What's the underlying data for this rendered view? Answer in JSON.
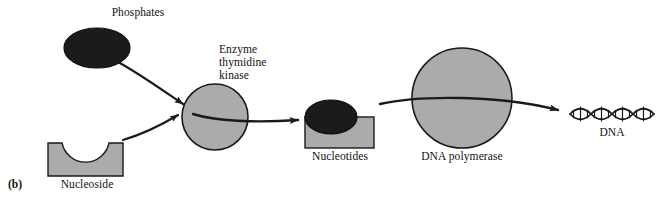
{
  "figure": {
    "panel_letter": "(b)",
    "width": 671,
    "height": 198,
    "background": "#ffffff"
  },
  "colors": {
    "shape_gray_fill": "#ababab",
    "shape_dark_fill": "#1d1a1a",
    "outline": "#1a1a1a",
    "text": "#111111"
  },
  "labels": {
    "phosphates": "Phosphates",
    "nucleoside": "Nucleoside",
    "enzyme_line1": "Enzyme",
    "enzyme_line2": "thymidine",
    "enzyme_line3": "kinase",
    "nucleotides": "Nucleotides",
    "dna_polymerase": "DNA polymerase",
    "dna": "DNA"
  },
  "shapes": [
    {
      "name": "phosphates-ellipse",
      "kind": "ellipse",
      "fill": "#1d1a1a",
      "cx": 97,
      "cy": 48,
      "rx": 33,
      "ry": 20
    },
    {
      "name": "nucleoside-block",
      "kind": "notched-rect",
      "fill": "#ababab",
      "x": 48,
      "y": 143,
      "w": 75,
      "h": 33,
      "notch_cx": 85,
      "notch_r": 24
    },
    {
      "name": "thymidine-kinase-circle",
      "kind": "circle",
      "fill": "#ababab",
      "cx": 215,
      "cy": 117,
      "r": 33
    },
    {
      "name": "nucleotides-block",
      "kind": "rect",
      "fill": "#ababab",
      "x": 305,
      "y": 117,
      "w": 69,
      "h": 31
    },
    {
      "name": "nucleotides-ellipse",
      "kind": "ellipse",
      "fill": "#1d1a1a",
      "cx": 331,
      "cy": 117,
      "rx": 26,
      "ry": 17
    },
    {
      "name": "dna-polymerase-circle",
      "kind": "circle",
      "fill": "#ababab",
      "cx": 462,
      "cy": 98,
      "r": 50
    },
    {
      "name": "dna-double-helix",
      "kind": "helix",
      "x_start": 570,
      "x_end": 655,
      "cy": 114,
      "amplitude": 7,
      "crossings": 6
    }
  ],
  "arrows": [
    {
      "name": "phosphates-to-kinase-arrow",
      "from": "phosphates-ellipse",
      "to": "thymidine-kinase-circle"
    },
    {
      "name": "nucleoside-to-kinase-arrow",
      "from": "nucleoside-block",
      "to": "thymidine-kinase-circle"
    },
    {
      "name": "kinase-to-nucleotides-arrow",
      "from": "thymidine-kinase-circle",
      "to": "nucleotides-block"
    },
    {
      "name": "nucleotides-to-dna-arrow",
      "from": "nucleotides-block",
      "to": "dna-double-helix"
    }
  ]
}
